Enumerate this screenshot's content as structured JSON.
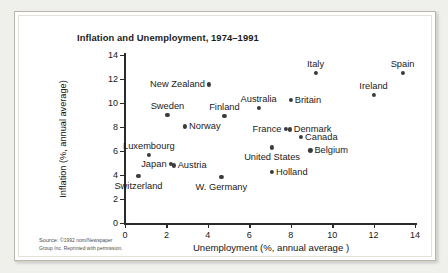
{
  "chart_data": {
    "type": "scatter",
    "title": "Inflation and Unemployment, 1974–1991",
    "xlabel": "Unemployment (%, annual average )",
    "ylabel": "Inflation (%, annual average)",
    "xlim": [
      0,
      14
    ],
    "ylim": [
      0,
      14
    ],
    "xticks": [
      0,
      2,
      4,
      6,
      8,
      10,
      12,
      14
    ],
    "yticks": [
      0,
      2,
      4,
      6,
      8,
      10,
      12,
      14
    ],
    "grid": false,
    "legend": "none",
    "point_color": "#3b3b3b",
    "points": [
      {
        "label": "Switzerland",
        "x": 0.65,
        "y": 3.9,
        "side": "below"
      },
      {
        "label": "Luxembourg",
        "x": 1.15,
        "y": 5.7,
        "side": "above"
      },
      {
        "label": "Japan",
        "x": 2.2,
        "y": 4.9,
        "side": "left"
      },
      {
        "label": "Austria",
        "x": 2.35,
        "y": 4.8,
        "side": "right"
      },
      {
        "label": "Sweden",
        "x": 2.05,
        "y": 9.0,
        "side": "above"
      },
      {
        "label": "Norway",
        "x": 2.9,
        "y": 8.05,
        "side": "right"
      },
      {
        "label": "New Zealand",
        "x": 4.05,
        "y": 11.55,
        "side": "left"
      },
      {
        "label": "W. Germany",
        "x": 4.65,
        "y": 3.85,
        "side": "below"
      },
      {
        "label": "Finland",
        "x": 4.8,
        "y": 8.95,
        "side": "above"
      },
      {
        "label": "Australia",
        "x": 6.45,
        "y": 9.6,
        "side": "above"
      },
      {
        "label": "United States",
        "x": 7.1,
        "y": 6.3,
        "side": "below"
      },
      {
        "label": "Holland",
        "x": 7.1,
        "y": 4.25,
        "side": "right"
      },
      {
        "label": "France",
        "x": 7.75,
        "y": 7.85,
        "side": "left"
      },
      {
        "label": "Denmark",
        "x": 7.95,
        "y": 7.8,
        "side": "right"
      },
      {
        "label": "Britain",
        "x": 8.0,
        "y": 10.25,
        "side": "right"
      },
      {
        "label": "Canada",
        "x": 8.5,
        "y": 7.15,
        "side": "right"
      },
      {
        "label": "Belgium",
        "x": 8.95,
        "y": 6.05,
        "side": "right"
      },
      {
        "label": "Italy",
        "x": 9.2,
        "y": 12.5,
        "side": "above"
      },
      {
        "label": "Ireland",
        "x": 12.0,
        "y": 10.65,
        "side": "above"
      },
      {
        "label": "Spain",
        "x": 13.4,
        "y": 12.5,
        "side": "above"
      }
    ]
  },
  "source": {
    "line1_smallcaps": "Source:",
    "line1_rest": " ©1992 nom/Newspaper",
    "line2": "Group Inc. Reprinted with permission."
  }
}
